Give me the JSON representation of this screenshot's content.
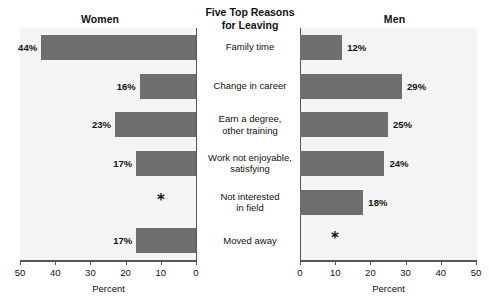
{
  "center": {
    "title_line1": "Five Top Reasons",
    "title_line2": "for Leaving"
  },
  "panels": {
    "left_title": "Women",
    "right_title": "Men"
  },
  "axis": {
    "title": "Percent",
    "left_ticks": [
      "50",
      "40",
      "30",
      "20",
      "10",
      "0"
    ],
    "right_ticks": [
      "0",
      "10",
      "20",
      "30",
      "40",
      "50"
    ]
  },
  "categories": [
    {
      "line1": "Family time",
      "line2": ""
    },
    {
      "line1": "Change in career",
      "line2": ""
    },
    {
      "line1": "Earn a degree,",
      "line2": "other training"
    },
    {
      "line1": "Work not enjoyable,",
      "line2": "satisfying"
    },
    {
      "line1": "Not interested",
      "line2": "in field"
    },
    {
      "line1": "Moved away",
      "line2": ""
    }
  ],
  "women_labels": [
    "44%",
    "16%",
    "23%",
    "17%",
    "*",
    "17%"
  ],
  "men_labels": [
    "12%",
    "29%",
    "25%",
    "24%",
    "18%",
    "*"
  ],
  "colors": {
    "bar": "#6e6e6e",
    "plot_bg": "#f4f4f4",
    "axis": "#555555",
    "text": "#111111"
  },
  "chart_data": {
    "type": "bar",
    "title": "Five Top Reasons for Leaving",
    "orientation": "horizontal",
    "layout": "back-to-back (diverging) paired horizontal bar chart",
    "categories": [
      "Family time",
      "Change in career",
      "Earn a degree, other training",
      "Work not enjoyable, satisfying",
      "Not interested in field",
      "Moved away"
    ],
    "series": [
      {
        "name": "Women",
        "values": [
          44,
          16,
          23,
          17,
          null,
          17
        ],
        "labels": [
          "44%",
          "16%",
          "23%",
          "17%",
          "*",
          "17%"
        ],
        "direction": "left"
      },
      {
        "name": "Men",
        "values": [
          12,
          29,
          25,
          24,
          18,
          null
        ],
        "labels": [
          "12%",
          "29%",
          "25%",
          "24%",
          "18%",
          "*"
        ],
        "direction": "right"
      }
    ],
    "xlabel": "Percent",
    "ylabel": "",
    "xlim": [
      0,
      50
    ],
    "xticks": [
      0,
      10,
      20,
      30,
      40,
      50
    ],
    "grid": false,
    "legend": "none (panel titles act as series labels)",
    "annotations": [
      {
        "series": "Women",
        "category": "Not interested in field",
        "symbol": "*",
        "meaning": "value not shown / suppressed"
      },
      {
        "series": "Men",
        "category": "Moved away",
        "symbol": "*",
        "meaning": "value not shown / suppressed"
      }
    ]
  }
}
